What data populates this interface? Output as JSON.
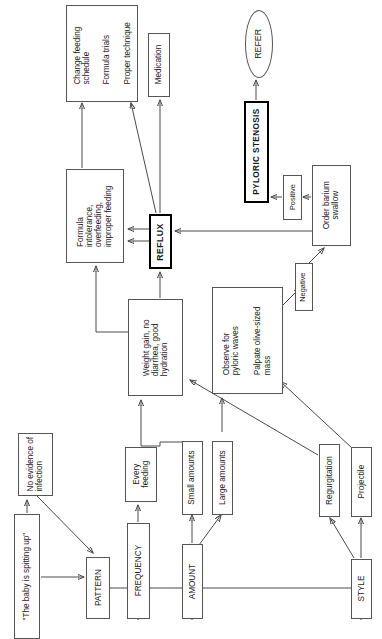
{
  "diagram": {
    "title_note": "Clinical decision flowchart for infant spitting up (page rotated 90 degrees)",
    "nodes": {
      "complaint": {
        "label": "\"The baby is spitting up\""
      },
      "no_infection": {
        "line1": "No evidence of",
        "line2": "infection"
      },
      "pattern": {
        "label": "PATTERN"
      },
      "frequency": {
        "label": "FREQUENCY"
      },
      "amount": {
        "label": "AMOUNT"
      },
      "style": {
        "label": "STYLE"
      },
      "every_feeding": {
        "line1": "Every",
        "line2": "feeding"
      },
      "small_amounts": {
        "label": "Small amounts"
      },
      "large_amounts": {
        "label": "Large amounts"
      },
      "regurgitation": {
        "label": "Regurgitation"
      },
      "projectile": {
        "label": "Projectile"
      },
      "weight_gain": {
        "line1": "Weight gain, no",
        "line2": "diarrhea, good",
        "line3": "hydration"
      },
      "observe": {
        "g1_line1": "Observe for",
        "g1_line2": "pyloric waves",
        "g2_line1": "Palpate olive-sized",
        "g2_line2": "mass"
      },
      "negative": {
        "label": "Negative"
      },
      "positive": {
        "label": "Positive"
      },
      "order_barium": {
        "line1": "Order barium",
        "line2": "swallow"
      },
      "pyloric_stenosis": {
        "label": "PYLORIC STENOSIS"
      },
      "refer": {
        "label": "REFER"
      },
      "reflux": {
        "label": "REFLUX"
      },
      "formula": {
        "line1": "Formula",
        "line2": "intolerance,",
        "line3": "overfeeding,",
        "line4": "improper feeding"
      },
      "treatment": {
        "g1_line1": "Change feeding",
        "g1_line2": "schedule",
        "g2_line1": "Formula trials",
        "g3_line1": "Proper technique"
      },
      "medication": {
        "label": "Medication"
      }
    },
    "colors": {
      "stroke": "#4a4a4a",
      "node_border": "#555555",
      "emphasis_border": "#000000",
      "text": "#1a1a1a",
      "background": "#ffffff"
    }
  }
}
